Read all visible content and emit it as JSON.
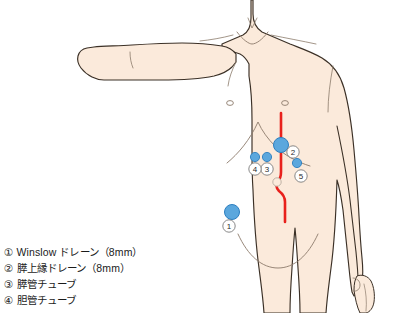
{
  "illustration": {
    "title": "Abdominal drain placement diagram",
    "subject": "male-torso-anterior-view",
    "colors": {
      "skin_fill": "#fbeadb",
      "skin_outline": "#3b3026",
      "skin_inner_line": "#8c7b6b",
      "incision_line": "#e8211c",
      "drain_dot": "#5ba7dd",
      "drain_dot_outline": "#2d7fc0",
      "callout_circle": "#6b6b6b",
      "background": "#ffffff"
    },
    "incision": {
      "name": "midline-laparotomy-incision",
      "description": "vertical red midline incision detouring around the navel"
    },
    "navel": {
      "name": "navel",
      "cx": 282,
      "cy": 182
    }
  },
  "markers": [
    {
      "id": "1",
      "label": "①",
      "cx": 232,
      "cy": 212,
      "r": 7.5,
      "callout_x": 229,
      "callout_y": 226,
      "size": "large"
    },
    {
      "id": "2",
      "label": "②",
      "cx": 281,
      "cy": 145,
      "r": 7.5,
      "callout_x": 292,
      "callout_y": 152,
      "size": "large"
    },
    {
      "id": "3",
      "label": "③",
      "cx": 267,
      "cy": 158,
      "r": 4.5,
      "callout_x": 267,
      "callout_y": 168,
      "size": "small"
    },
    {
      "id": "4",
      "label": "④",
      "cx": 255,
      "cy": 158,
      "r": 4.5,
      "callout_x": 255,
      "callout_y": 168,
      "size": "small"
    },
    {
      "id": "5",
      "label": "⑤",
      "cx": 297,
      "cy": 164,
      "r": 4.5,
      "callout_x": 301,
      "callout_y": 176,
      "size": "small"
    }
  ],
  "legend": {
    "items": [
      {
        "marker": "①",
        "text": "Winslow ドレーン（8mm）"
      },
      {
        "marker": "②",
        "text": "膵上縁ドレーン（8mm）"
      },
      {
        "marker": "③",
        "text": "膵管チューブ"
      },
      {
        "marker": "④",
        "text": "胆管チューブ"
      }
    ]
  }
}
